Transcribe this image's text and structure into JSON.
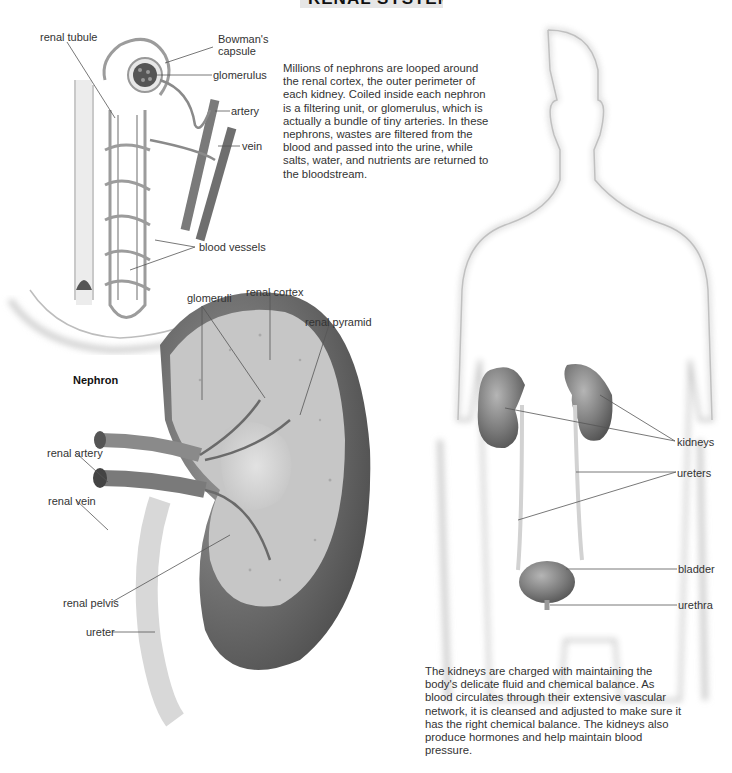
{
  "header": {
    "title": "RENAL SYSTEM"
  },
  "nephron": {
    "caption": "Nephron",
    "labels": {
      "renal_tubule": "renal tubule",
      "bowmans_capsule_1": "Bowman's",
      "bowmans_capsule_2": "capsule",
      "glomerulus": "glomerulus",
      "artery": "artery",
      "vein": "vein",
      "blood_vessels": "blood vessels"
    }
  },
  "kidney_section": {
    "labels": {
      "glomeruli": "glomeruli",
      "renal_cortex": "renal cortex",
      "renal_pyramid": "renal pyramid",
      "renal_artery": "renal artery",
      "renal_vein": "renal vein",
      "renal_pelvis": "renal pelvis",
      "ureter": "ureter"
    }
  },
  "body_figure": {
    "labels": {
      "kidneys": "kidneys",
      "ureters": "ureters",
      "bladder": "bladder",
      "urethra": "urethra"
    }
  },
  "text": {
    "nephron_paragraph": "Millions of nephrons are looped around the renal cortex, the outer perimeter of each kidney. Coiled inside each nephron is a filtering unit, or glomerulus, which is actually a bundle of tiny arteries. In these nephrons, wastes are filtered from the blood and passed into the urine, while salts, water, and nutrients are returned to the bloodstream.",
    "kidney_paragraph": "The kidneys are charged with maintaining the body's delicate fluid and chemical balance. As blood circulates through their extensive vascular network, it is cleansed and adjusted to make sure it has the right chemical balance. The kidneys also produce hormones and help maintain blood pressure."
  },
  "colors": {
    "title_band": "#e6e6e6",
    "organ_gray": "#7a7a7a",
    "cortex_dark": "#5c5c5c",
    "leader_line": "#555555"
  }
}
